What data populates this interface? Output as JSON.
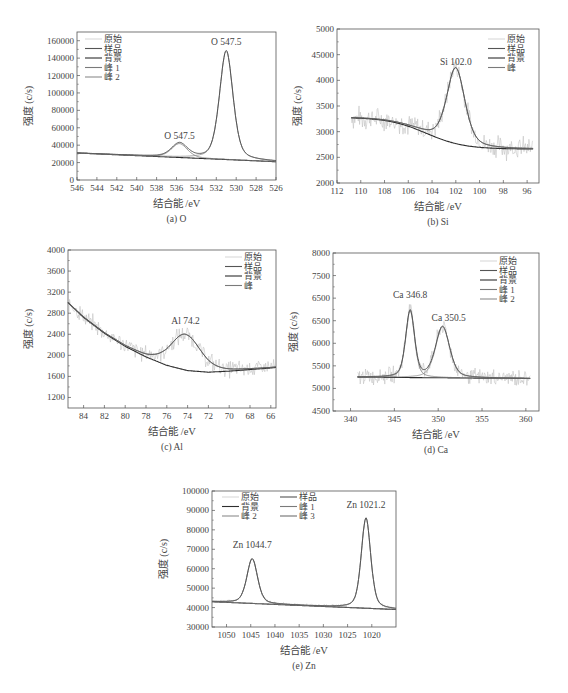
{
  "figure_caption": "",
  "common": {
    "ylabel": "强度 (c/s)",
    "xlabel": "结合能 /eV"
  },
  "colors": {
    "raw": "#b8b8b8",
    "sample": "#555555",
    "background": "#2e2e2e",
    "peak1": "#7a7a7a",
    "peak2": "#8c8c8c",
    "peak3": "#6f6f6f",
    "frame": "#555555",
    "text": "#444444"
  },
  "chart_data": [
    {
      "id": "O",
      "type": "line",
      "caption": "(a) O",
      "xlabel": "结合能 /eV",
      "ylabel": "强度 (c/s)",
      "frame": {
        "left": 77,
        "top": 32,
        "right": 276,
        "bottom": 180
      },
      "xlim": [
        546,
        526
      ],
      "ylim": [
        0,
        170000
      ],
      "xticks": [
        546,
        544,
        542,
        540,
        538,
        536,
        534,
        532,
        530,
        528,
        526
      ],
      "yticks": [
        0,
        20000,
        40000,
        60000,
        80000,
        100000,
        120000,
        140000,
        160000
      ],
      "ytick_labels": [
        "0",
        "20000",
        "40000",
        "60000",
        "80000",
        "100000",
        "120000",
        "140000",
        "160000"
      ],
      "legend": [
        "原始",
        "样品",
        "背景",
        "峰 1",
        "峰 2"
      ],
      "legend_pos": {
        "x": 85,
        "y": 42,
        "cols": 1
      },
      "background": {
        "x": [
          546,
          526
        ],
        "y": [
          31000,
          21000
        ]
      },
      "peaks": [
        {
          "name": "峰 1",
          "center": 535.7,
          "height": 16000,
          "fwhm": 1.9,
          "label": "O 547.5",
          "label_pos": [
            535.7,
            47500
          ]
        },
        {
          "name": "峰 2",
          "center": 531.0,
          "height": 125000,
          "fwhm": 1.6,
          "label": "O 547.5",
          "label_pos": [
            531.0,
            155000
          ]
        }
      ],
      "noise": 0
    },
    {
      "id": "Si",
      "type": "line",
      "caption": "(b) Si",
      "xlabel": "结合能 /eV",
      "ylabel": "强度 (c/s)",
      "frame": {
        "left": 337,
        "top": 29,
        "right": 539,
        "bottom": 183
      },
      "xlim": [
        112,
        95
      ],
      "ylim": [
        2000,
        5000
      ],
      "xticks": [
        112,
        110,
        108,
        106,
        104,
        102,
        100,
        98,
        96
      ],
      "yticks": [
        2000,
        2500,
        3000,
        3500,
        4000,
        4500,
        5000
      ],
      "ytick_labels": [
        "2000",
        "2500",
        "3000",
        "3500",
        "4000",
        "45000",
        "5000"
      ],
      "legend": [
        "原始",
        "样品",
        "背景",
        "峰"
      ],
      "legend_pos": {
        "x": 488,
        "y": 42,
        "cols": 1
      },
      "background": {
        "type": "step",
        "x_start": 110.8,
        "x_end": 95.5,
        "high": 3280,
        "low": 2660,
        "mid": 104.5,
        "width": 1.6
      },
      "peaks": [
        {
          "name": "峰",
          "center": 102.0,
          "height": 1480,
          "fwhm": 1.8,
          "label": "Si 102.0",
          "label_pos": [
            102.0,
            4300
          ]
        }
      ],
      "noise": 180
    },
    {
      "id": "Al",
      "type": "line",
      "caption": "(c) Al",
      "xlabel": "结合能 /eV",
      "ylabel": "强度 (c/s)",
      "frame": {
        "left": 68,
        "top": 250,
        "right": 276,
        "bottom": 408
      },
      "xlim": [
        85.5,
        65.5
      ],
      "ylim": [
        1000,
        4000
      ],
      "xticks": [
        84,
        82,
        80,
        78,
        76,
        74,
        72,
        70,
        68,
        66
      ],
      "yticks": [
        1200,
        1600,
        2000,
        2400,
        2800,
        3200,
        3600,
        4000
      ],
      "ytick_labels": [
        "1200",
        "1600",
        "2000",
        "2400",
        "2800",
        "3200",
        "3600",
        "4000"
      ],
      "legend": [
        "原始",
        "样品",
        "背景",
        "峰"
      ],
      "legend_pos": {
        "x": 225,
        "y": 260,
        "cols": 1
      },
      "background": {
        "type": "curve",
        "x": [
          85.5,
          84,
          82,
          80,
          78,
          76,
          74,
          72,
          70,
          68,
          66,
          65.5
        ],
        "y": [
          3000,
          2720,
          2420,
          2170,
          1970,
          1810,
          1710,
          1680,
          1700,
          1730,
          1760,
          1770
        ]
      },
      "peaks": [
        {
          "name": "峰",
          "center": 74.2,
          "height": 680,
          "fwhm": 3.4,
          "label": "Al 74.2",
          "label_pos": [
            74.2,
            2600
          ]
        }
      ],
      "noise": 140
    },
    {
      "id": "Ca",
      "type": "line",
      "caption": "(d) Ca",
      "xlabel": "结合能 /eV",
      "ylabel": "强度 (c/s)",
      "frame": {
        "left": 333,
        "top": 253,
        "right": 539,
        "bottom": 411
      },
      "xlim": [
        338,
        361.5
      ],
      "ylim": [
        4500,
        8000
      ],
      "xticks": [
        340,
        345,
        350,
        355,
        360
      ],
      "yticks": [
        4500,
        5000,
        5500,
        6000,
        6500,
        7000,
        7500,
        8000
      ],
      "ytick_labels": [
        "4500",
        "5000",
        "5500",
        "6000",
        "6500",
        "6500",
        "7500",
        "8000"
      ],
      "legend": [
        "原始",
        "样品",
        "背景",
        "峰 1",
        "峰 2"
      ],
      "legend_pos": {
        "x": 480,
        "y": 264,
        "cols": 1
      },
      "background": {
        "x": [
          340.8,
          360.5
        ],
        "y": [
          5250,
          5220
        ]
      },
      "peaks": [
        {
          "name": "峰 1",
          "center": 346.8,
          "height": 1480,
          "fwhm": 1.2,
          "label": "Ca 346.8",
          "label_pos": [
            346.8,
            7000
          ]
        },
        {
          "name": "峰 2",
          "center": 350.5,
          "height": 1130,
          "fwhm": 1.9,
          "label": "Ca 350.5",
          "label_pos": [
            351.2,
            6500
          ]
        }
      ],
      "noise": 150
    },
    {
      "id": "Zn",
      "type": "line",
      "caption": "(e) Zn",
      "xlabel": "结合能 /eV",
      "ylabel": "强度 (c/s)",
      "frame": {
        "left": 212,
        "top": 491,
        "right": 396,
        "bottom": 627
      },
      "xlim": [
        1053,
        1015
      ],
      "ylim": [
        30000,
        100000
      ],
      "xticks": [
        1050,
        1045,
        1040,
        1035,
        1030,
        1025,
        1020
      ],
      "yticks": [
        30000,
        40000,
        50000,
        60000,
        70000,
        80000,
        90000,
        100000
      ],
      "ytick_labels": [
        "30000",
        "40000",
        "50000",
        "60000",
        "70000",
        "80000",
        "90000",
        "100000"
      ],
      "legend": [
        "原始",
        "样品",
        "背景",
        "峰 1",
        "峰 2",
        "峰 3"
      ],
      "legend_pos": {
        "x": 222,
        "y": 500,
        "cols": 2
      },
      "background": {
        "x": [
          1053,
          1015
        ],
        "y": [
          43000,
          39000
        ]
      },
      "peaks": [
        {
          "name": "峰 1",
          "center": 1044.7,
          "height": 23000,
          "fwhm": 2.6,
          "label": "Zn 1044.7",
          "label_pos": [
            1044.7,
            70500
          ]
        },
        {
          "name": "峰 2",
          "center": 1021.2,
          "height": 46500,
          "fwhm": 2.3,
          "label": "Zn 1021.2",
          "label_pos": [
            1021.2,
            91500
          ]
        }
      ],
      "noise": 600
    }
  ]
}
